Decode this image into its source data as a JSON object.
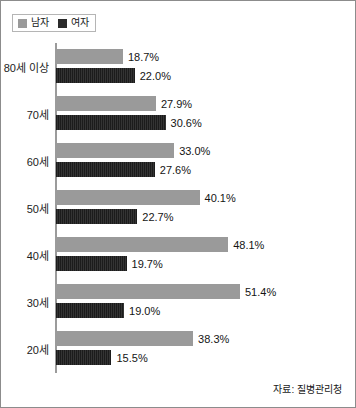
{
  "legend": {
    "entries": [
      {
        "label": "남자",
        "color": "#9a9a9a"
      },
      {
        "label": "여자",
        "color": "#232323"
      }
    ]
  },
  "source": {
    "text": "자료: 질병관리청"
  },
  "chart_data": {
    "type": "bar",
    "orientation": "horizontal",
    "title": "",
    "xlabel": "",
    "ylabel": "",
    "xlim": [
      0,
      55
    ],
    "grid": false,
    "legend_position": "top-left",
    "categories": [
      "80세 이상",
      "70세",
      "60세",
      "50세",
      "40세",
      "30세",
      "20세"
    ],
    "series": [
      {
        "name": "남자",
        "color": "#9a9a9a",
        "values": [
          18.7,
          27.9,
          33.0,
          40.1,
          48.1,
          51.4,
          38.3
        ],
        "labels": [
          "18.7%",
          "27.9%",
          "33.0%",
          "40.1%",
          "48.1%",
          "51.4%",
          "38.3%"
        ]
      },
      {
        "name": "여자",
        "color": "#232323",
        "values": [
          22.0,
          30.6,
          27.6,
          22.7,
          19.7,
          19.0,
          15.5
        ],
        "labels": [
          "22.0%",
          "30.6%",
          "27.6%",
          "22.7%",
          "19.7%",
          "19.0%",
          "15.5%"
        ]
      }
    ]
  }
}
